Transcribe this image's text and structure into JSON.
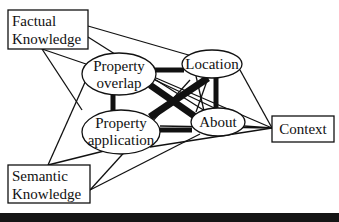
{
  "diagram": {
    "nodes": {
      "factual": {
        "line1": "Factual",
        "line2": "Knowledge"
      },
      "semantic": {
        "line1": "Semantic",
        "line2": "Knowledge"
      },
      "overlap": {
        "line1": "Property",
        "line2": "overlap"
      },
      "application": {
        "line1": "Property",
        "line2": "application"
      },
      "location": {
        "label": "Location"
      },
      "about": {
        "label": "About"
      },
      "context": {
        "label": "Context"
      }
    },
    "colors": {
      "line": "#111111",
      "background": "#ffffff",
      "bar": "#151515"
    }
  }
}
